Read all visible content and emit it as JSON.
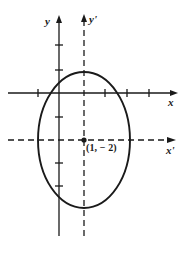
{
  "figure": {
    "kind": "conic-section-translated-axes-diagram",
    "width": 190,
    "height": 255,
    "background_color": "#ffffff",
    "stroke_color": "#1a1a1a"
  },
  "axes": {
    "x": {
      "label": "x",
      "style": "solid",
      "orientation": "horizontal",
      "y_pixel": 93,
      "start_x": 8,
      "end_x": 178,
      "arrow": "right",
      "tick_pixels": [
        38,
        105,
        127,
        149
      ],
      "tick_half_length": 4
    },
    "y": {
      "label": "y",
      "style": "solid",
      "orientation": "vertical",
      "x_pixel": 59,
      "start_y": 16,
      "end_y": 236,
      "arrow": "up",
      "tick_pixels": [
        45,
        70,
        117,
        163,
        186
      ],
      "tick_half_length": 4
    },
    "x_prime": {
      "label": "x'",
      "style": "dashed",
      "orientation": "horizontal",
      "y_pixel": 140,
      "start_x": 8,
      "end_x": 176,
      "arrow": "right"
    },
    "y_prime": {
      "label": "y'",
      "style": "dashed",
      "orientation": "vertical",
      "x_pixel": 84,
      "start_y": 15,
      "end_y": 236,
      "arrow": "up"
    }
  },
  "ellipse": {
    "center_x_pixel": 84,
    "center_y_pixel": 140,
    "radius_x_pixel": 46,
    "radius_y_pixel": 68,
    "stroke_width": 1.8,
    "fill": "none"
  },
  "center_point": {
    "label": "(1, − 2)",
    "x_pixel": 84,
    "y_pixel": 140,
    "dot_radius": 2.6
  }
}
